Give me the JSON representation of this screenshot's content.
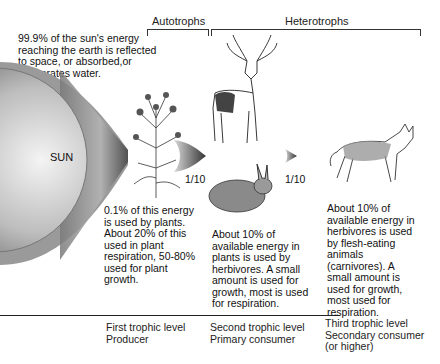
{
  "headers": {
    "autotrophs": "Autotrophs",
    "heterotrophs": "Heterotrophs"
  },
  "intro_text": [
    "99.9% of the sun's energy",
    "reaching the earth is reflected",
    "to space, or absorbed,or",
    "evaporates water."
  ],
  "sun_label": "SUN",
  "ratios": [
    "1/10",
    "1/10"
  ],
  "descriptions": {
    "producer": [
      "0.1% of this energy",
      "is used by plants.",
      "About 20% of this",
      "used in plant",
      "respiration, 50-80%",
      "used for plant",
      "growth."
    ],
    "primary": [
      "About 10% of",
      "available energy in",
      "plants is used by",
      "herbivores. A small",
      "amount is used for",
      "growth, most is used",
      "for respiration."
    ],
    "secondary": [
      "About 10% of",
      "available energy in",
      "herbivores is used",
      "by flesh-eating",
      "animals",
      "(carnivores). A",
      "small amount is",
      "used for growth,",
      "most used for",
      "respiration."
    ]
  },
  "levels": [
    {
      "line1": "First trophic level",
      "line2": "Producer",
      "line3": ""
    },
    {
      "line1": "Second trophic level",
      "line2": "Primary consumer",
      "line3": ""
    },
    {
      "line1": "Third trophic level",
      "line2": "Secondary consumer",
      "line3": "(or higher)"
    }
  ],
  "illustrations": [
    "plant-illustration",
    "deer-illustration",
    "rabbit-illustration",
    "coyote-illustration"
  ]
}
